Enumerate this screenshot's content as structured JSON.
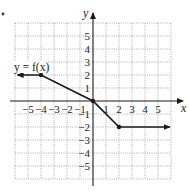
{
  "chart_data": {
    "type": "line",
    "title": "",
    "function_label": "y = f(x)",
    "xlabel": "x",
    "ylabel": "y",
    "xlim": [
      -6,
      6
    ],
    "ylim": [
      -6,
      6
    ],
    "grid": true,
    "x_ticks": [
      "−5",
      "−4",
      "−3",
      "−2",
      "−1",
      "1",
      "2",
      "3",
      "4",
      "5"
    ],
    "y_ticks": [
      "5",
      "4",
      "3",
      "2",
      "1",
      "−1",
      "−2",
      "−3",
      "−4",
      "−5"
    ],
    "series": [
      {
        "name": "f(x)",
        "points": [
          [
            -5.8,
            2
          ],
          [
            -4,
            2
          ],
          [
            0,
            0
          ],
          [
            2,
            -2
          ],
          [
            5.9,
            -2
          ]
        ],
        "marked_points": [
          [
            -4,
            2
          ],
          [
            0,
            0
          ],
          [
            2,
            -2
          ]
        ],
        "left_arrow": true,
        "right_arrow": true
      }
    ],
    "colors": {
      "line": "#1a1a1a",
      "grid": "#9a9a9a",
      "axis": "#1a1a1a"
    }
  }
}
